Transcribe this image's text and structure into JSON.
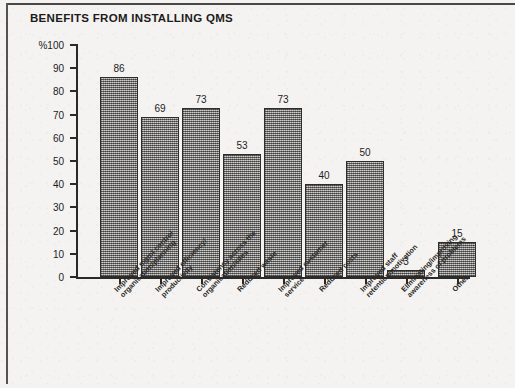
{
  "figure": {
    "title": "BENEFITS FROM INSTALLING QMS",
    "y_axis_unit_label": "%100"
  },
  "chart_data": {
    "type": "bar",
    "title": "BENEFITS FROM INSTALLING QMS",
    "xlabel": "",
    "ylabel": "%",
    "ylim": [
      0,
      100
    ],
    "yticks": [
      0,
      10,
      20,
      30,
      40,
      50,
      60,
      70,
      80,
      90,
      100
    ],
    "grid": false,
    "legend": null,
    "bar_color": "#8d8b88",
    "bar_edge_color": "#2e2d2c",
    "categories": [
      "Improved mgmt control organisation/planning",
      "Improved efficiency/ productivity",
      "Consistency across the organisation/sites",
      "Reduced waste",
      "Improved customer service",
      "Reduced costs",
      "Improved staff retention/motivation",
      "Eliminating/improving awareness of problems",
      "Other"
    ],
    "category_lines": [
      [
        "Improved mgmt control",
        "organisation/planning"
      ],
      [
        "Improved efficiency/",
        "productivity"
      ],
      [
        "Consistency across the",
        "organisation/sites"
      ],
      [
        "Reduced waste",
        ""
      ],
      [
        "Improved customer",
        "service"
      ],
      [
        "Reduced costs",
        ""
      ],
      [
        "Improved staff",
        "retention/motivation"
      ],
      [
        "Eliminating/improving",
        "awareness of problems"
      ],
      [
        "Other",
        ""
      ]
    ],
    "values": [
      86,
      69,
      73,
      53,
      73,
      40,
      50,
      3,
      15
    ],
    "value_labels": [
      "86",
      "69",
      "73",
      "53",
      "73",
      "40",
      "50",
      "3",
      "15"
    ]
  },
  "y_tick_labels": [
    "%100",
    "90",
    "80",
    "70",
    "60",
    "50",
    "40",
    "30",
    "20",
    "10",
    "0"
  ]
}
